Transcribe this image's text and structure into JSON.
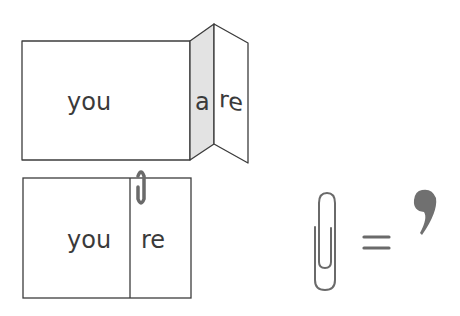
{
  "diagram": {
    "top_panel": {
      "main_word": "you",
      "folded_letter": "a",
      "right_word": "re",
      "fold_shade_color": "#e3e3e3"
    },
    "bottom_panel": {
      "left_word": "you",
      "right_word": "re",
      "clip_icon": "paperclip-icon"
    },
    "equation": {
      "left_icon": "paperclip-icon",
      "operator": "=",
      "right_symbol": "’"
    },
    "colors": {
      "stroke": "#3c3c3c",
      "clip": "#6a6a6a",
      "apostrophe": "#707070"
    }
  }
}
